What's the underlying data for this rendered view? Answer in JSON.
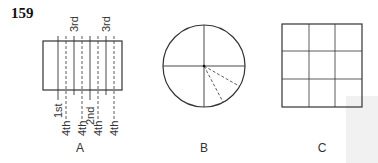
{
  "figure_number": "159",
  "panels": [
    {
      "id": "A",
      "label": "A",
      "shape": "rectangle",
      "solid_lines_top_labels": [
        "3rd",
        "3rd"
      ],
      "bottom_labels": [
        "1st",
        "4th",
        "4th",
        "2nd",
        "4th",
        "4th"
      ]
    },
    {
      "id": "B",
      "label": "B",
      "shape": "circle",
      "description": "circle divided into quarters by solid lines, with two dashed radii in lower-right quadrant"
    },
    {
      "id": "C",
      "label": "C",
      "shape": "square",
      "description": "square divided into 3x3 grid"
    }
  ],
  "colors": {
    "line": "#333333",
    "background": "#ffffff"
  }
}
